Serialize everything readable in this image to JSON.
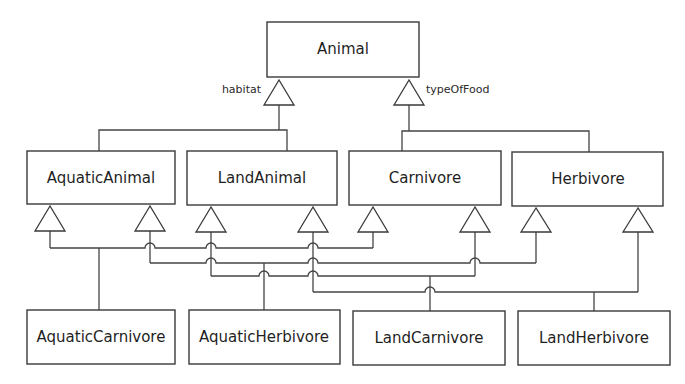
{
  "diagram": {
    "type": "UML class diagram (generalization with discriminators)",
    "root": {
      "id": "animal",
      "label": "Animal"
    },
    "discriminators": [
      {
        "label": "habitat",
        "children": [
          "AquaticAnimal",
          "LandAnimal"
        ]
      },
      {
        "label": "typeOfFood",
        "children": [
          "Carnivore",
          "Herbivore"
        ]
      }
    ],
    "middle": [
      {
        "id": "aquatic-animal",
        "label": "AquaticAnimal"
      },
      {
        "id": "land-animal",
        "label": "LandAnimal"
      },
      {
        "id": "carnivore",
        "label": "Carnivore"
      },
      {
        "id": "herbivore",
        "label": "Herbivore"
      }
    ],
    "bottom": [
      {
        "id": "aquatic-carnivore",
        "label": "AquaticCarnivore",
        "parents": [
          "AquaticAnimal",
          "Carnivore"
        ]
      },
      {
        "id": "aquatic-herbivore",
        "label": "AquaticHerbivore",
        "parents": [
          "AquaticAnimal",
          "Herbivore"
        ]
      },
      {
        "id": "land-carnivore",
        "label": "LandCarnivore",
        "parents": [
          "LandAnimal",
          "Carnivore"
        ]
      },
      {
        "id": "land-herbivore",
        "label": "LandHerbivore",
        "parents": [
          "LandAnimal",
          "Herbivore"
        ]
      }
    ]
  }
}
